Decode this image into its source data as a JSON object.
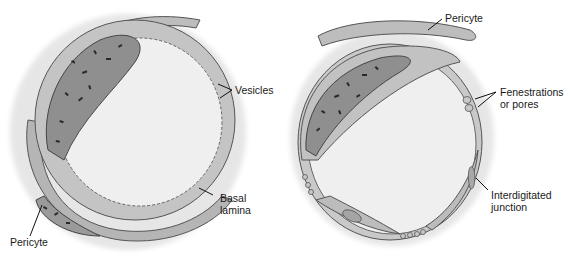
{
  "figure": {
    "panels": [
      {
        "id": "continuous-capillary",
        "labels": {
          "vesicles": "Vesicles",
          "basal_lamina_line1": "Basal",
          "basal_lamina_line2": "lamina",
          "pericyte": "Pericyte"
        }
      },
      {
        "id": "fenestrated-capillary",
        "labels": {
          "pericyte": "Pericyte",
          "fenestrations_line1": "Fenestrations",
          "fenestrations_line2": "or pores",
          "junction_line1": "Interdigitated",
          "junction_line2": "junction"
        }
      }
    ],
    "colors": {
      "lumen": "#eeeeee",
      "cytoplasm": "#b9b9b9",
      "cytoplasm_light": "#cfcfcf",
      "nucleus": "#8e8e8e",
      "outline": "#555555",
      "chromatin": "#2a2a2a",
      "halo": "#e6e6e6",
      "leader_line": "#111111",
      "text": "#1a1a1a"
    }
  }
}
